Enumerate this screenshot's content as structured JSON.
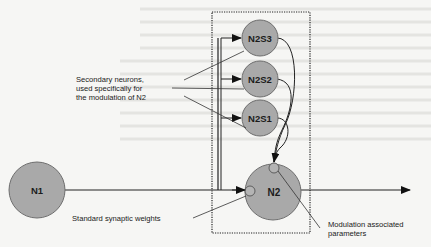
{
  "diagram": {
    "type": "neural-network-modulation",
    "nodes": {
      "n1": {
        "label": "N1"
      },
      "n2": {
        "label": "N2"
      },
      "n2s3": {
        "label": "N2S3"
      },
      "n2s2": {
        "label": "N2S2"
      },
      "n2s1": {
        "label": "N2S1"
      }
    },
    "annotations": {
      "secondary_line1": "Secondary neurons,",
      "secondary_line2": "used specifically for",
      "secondary_line3": "the modulation of N2",
      "standard_weights": "Standard synaptic weights",
      "modulation_line1": "Modulation associated",
      "modulation_line2": "parameters"
    },
    "edges": [
      {
        "from": "N1",
        "to": "N2",
        "kind": "standard synapse"
      },
      {
        "from": "N1",
        "to": "N2S3",
        "kind": "branch"
      },
      {
        "from": "N1",
        "to": "N2S2",
        "kind": "branch"
      },
      {
        "from": "N1",
        "to": "N2S1",
        "kind": "branch"
      },
      {
        "from": "N2S3",
        "to": "N2",
        "kind": "modulation"
      },
      {
        "from": "N2S2",
        "to": "N2",
        "kind": "modulation"
      },
      {
        "from": "N2S1",
        "to": "N2",
        "kind": "modulation"
      },
      {
        "from": "N2",
        "to": "output",
        "kind": "output"
      }
    ],
    "colors": {
      "node_fill": "#a9a9a9",
      "node_stroke": "#6e6e6e",
      "line": "#222222"
    }
  }
}
